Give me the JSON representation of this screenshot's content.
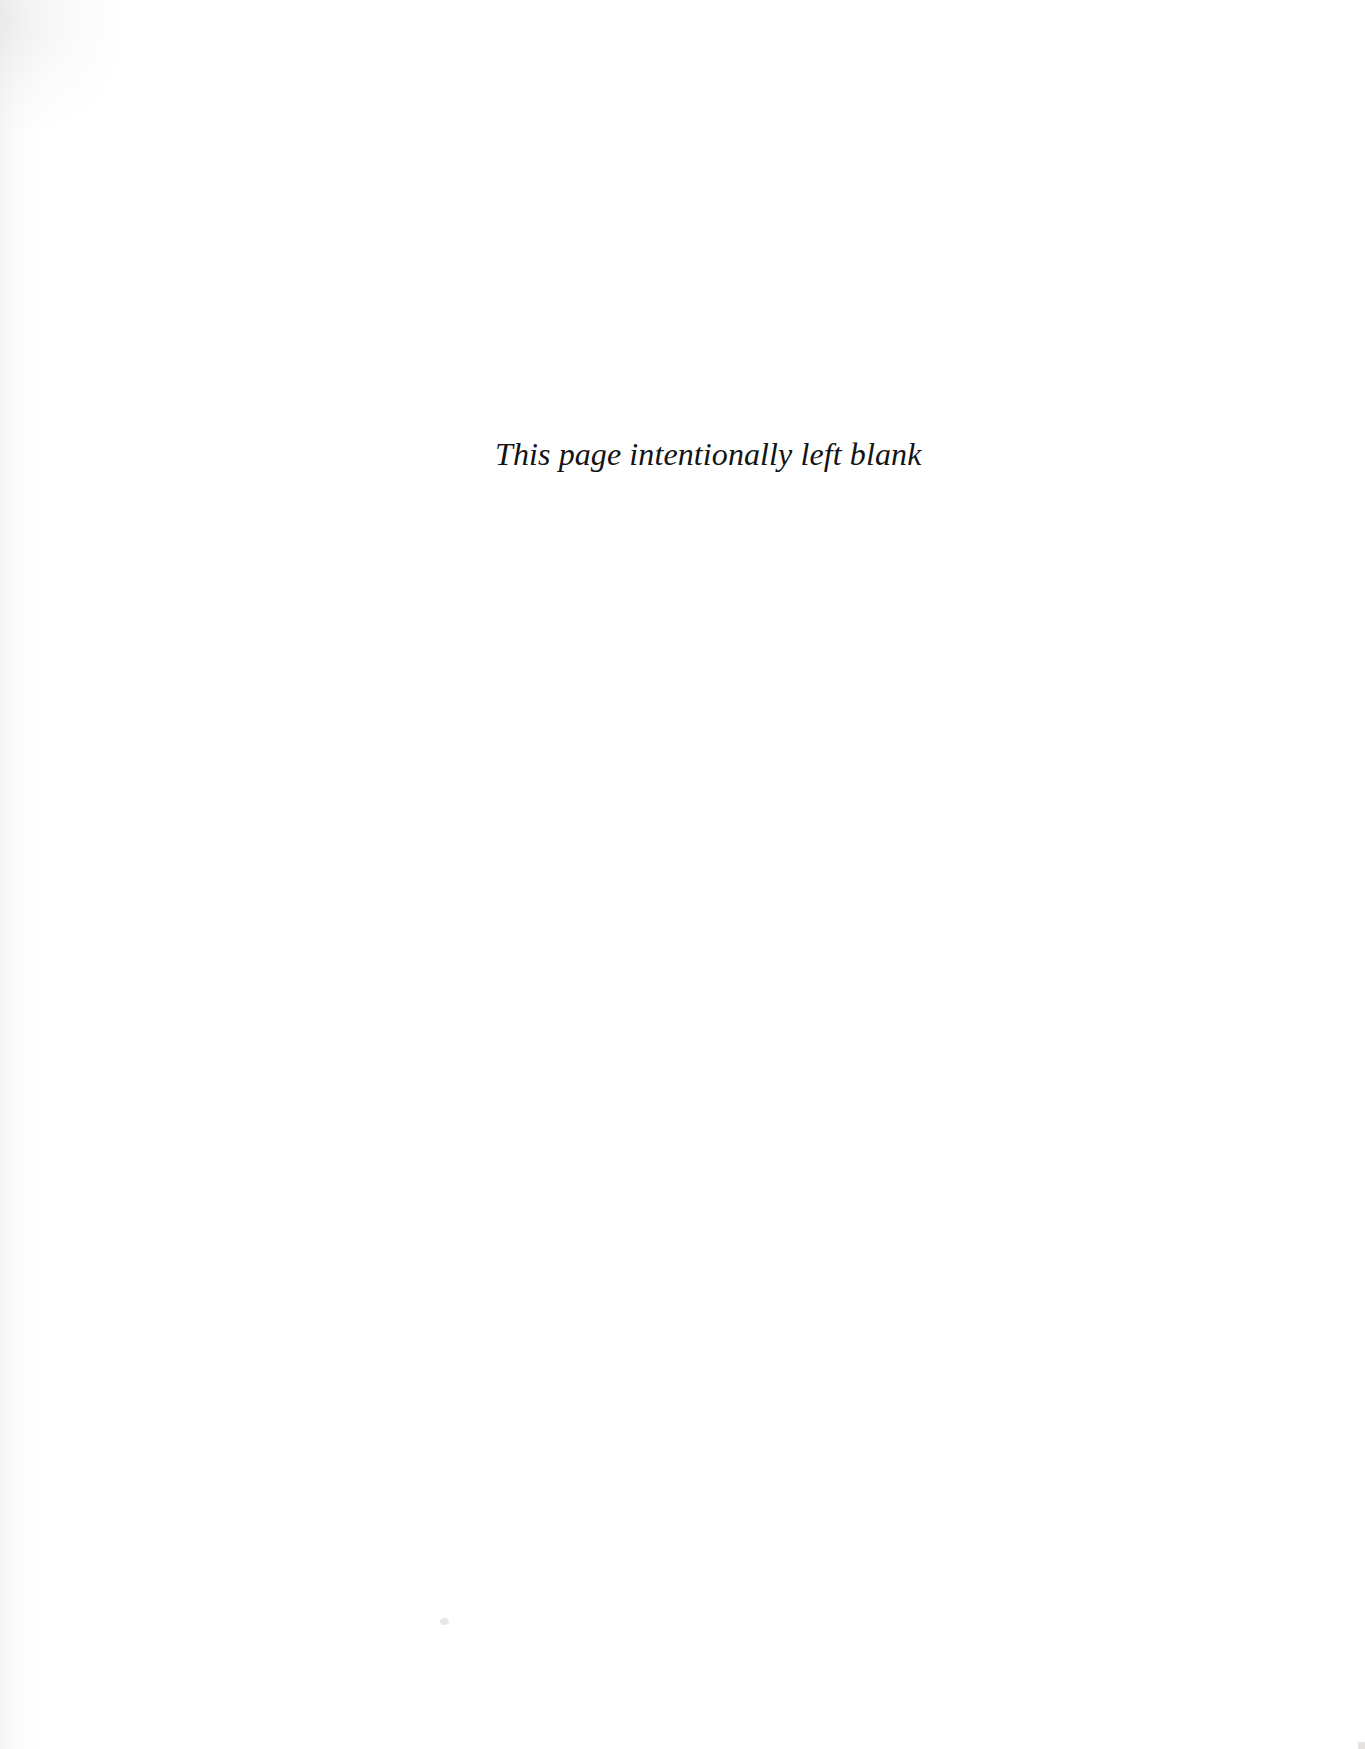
{
  "page": {
    "kind": "scanned-book-page",
    "background_color": "#ffffff",
    "text_color": "#141414",
    "width": 1365,
    "height": 1749
  },
  "content": {
    "blank_notice": "This page intentionally left blank"
  },
  "artifacts": {
    "left_edge_noise": "faint warm-gray scanner shading along left margin",
    "corner_noise": "faint tonal smudge at top-left corner",
    "speck": "small dust speck near lower middle of page",
    "corner_mark": "faint gray pixel at bottom-right corner"
  }
}
